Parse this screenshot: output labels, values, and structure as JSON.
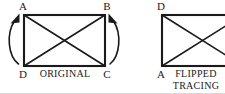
{
  "figure": {
    "background_color": "#ffffff",
    "ink_color": "#1a1a1a",
    "panels": [
      {
        "id": "original",
        "caption": "ORIGINAL",
        "caption_lines": [
          "ORIGINAL"
        ],
        "vertices": [
          {
            "label": "A",
            "position": "top-left"
          },
          {
            "label": "B",
            "position": "top-right"
          },
          {
            "label": "C",
            "position": "bottom-right"
          },
          {
            "label": "D",
            "position": "bottom-left"
          }
        ],
        "has_diagonals": true,
        "arrows": [
          {
            "id": "left-rotation-arrow",
            "direction": "up",
            "side": "left",
            "points_to": "A"
          },
          {
            "id": "right-rotation-arrow",
            "direction": "up",
            "side": "right",
            "points_to": "B"
          }
        ]
      },
      {
        "id": "flipped-tracing",
        "caption": "FLIPPED TRACING",
        "caption_lines": [
          "FLIPPED",
          "TRACING"
        ],
        "vertices": [
          {
            "label": "D",
            "position": "top-left"
          },
          {
            "label": "A",
            "position": "bottom-left"
          }
        ],
        "has_diagonals": true,
        "clipped_at_right_edge": true,
        "arrows": []
      }
    ]
  }
}
